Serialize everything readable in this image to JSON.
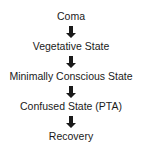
{
  "diagram": {
    "type": "vertical-flow",
    "steps": [
      {
        "label": "Coma"
      },
      {
        "label": "Vegetative State"
      },
      {
        "label": "Minimally Conscious State"
      },
      {
        "label": "Confused State (PTA)"
      },
      {
        "label": "Recovery"
      }
    ],
    "connector": {
      "icon": "arrow-down-icon",
      "color": "#1a1a1a"
    }
  }
}
